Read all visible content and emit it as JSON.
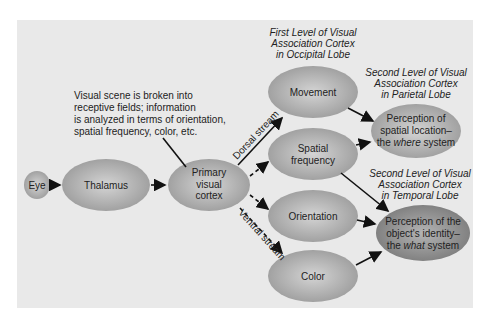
{
  "annotation": {
    "lines": [
      "Visual scene is broken into",
      "receptive fields; information",
      "is analyzed in terms of orientation,",
      "spatial frequency, color, etc."
    ]
  },
  "headings": {
    "first_level": [
      "First Level of Visual",
      "Association Cortex",
      "in Occipital Lobe"
    ],
    "second_parietal": [
      "Second Level of Visual",
      "Association Cortex",
      "in Parietal Lobe"
    ],
    "second_temporal": [
      "Second Level of Visual",
      "Association Cortex",
      "in Temporal Lobe"
    ]
  },
  "nodes": {
    "eye": "Eye",
    "thalamus": "Thalamus",
    "primary": [
      "Primary",
      "visual",
      "cortex"
    ],
    "movement": "Movement",
    "spatial": [
      "Spatial",
      "frequency"
    ],
    "orientation": "Orientation",
    "color": "Color",
    "where": [
      "Perception of",
      "spatial location–",
      "the ",
      "where",
      " system"
    ],
    "what": [
      "Perception of the",
      "object's identity–",
      "the ",
      "what",
      " system"
    ]
  },
  "streams": {
    "dorsal": "Dorsal stream",
    "ventral": "Ventral stream"
  }
}
